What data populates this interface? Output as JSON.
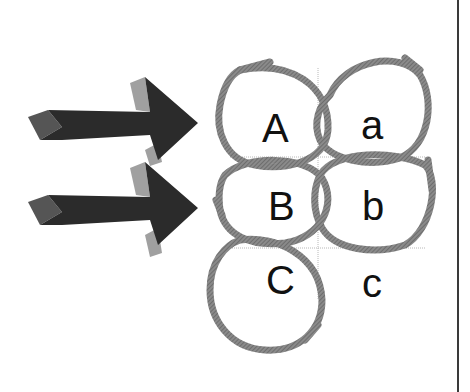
{
  "diagram": {
    "arrows": [
      {
        "name": "top-arrow",
        "direction": "right"
      },
      {
        "name": "bottom-arrow",
        "direction": "right"
      }
    ],
    "cells": [
      {
        "label": "A",
        "row": 0,
        "col": 0,
        "circled": true
      },
      {
        "label": "a",
        "row": 0,
        "col": 1,
        "circled": true
      },
      {
        "label": "B",
        "row": 1,
        "col": 0,
        "circled": true
      },
      {
        "label": "b",
        "row": 1,
        "col": 1,
        "circled": true
      },
      {
        "label": "C",
        "row": 2,
        "col": 0,
        "circled": true
      },
      {
        "label": "c",
        "row": 2,
        "col": 1,
        "circled": false
      }
    ],
    "colors": {
      "arrow_body": "#2a2a2a",
      "arrow_side": "#9a9a9a",
      "circle_stroke": "#7a7a7a",
      "guide_line": "#b0b0b0",
      "border": "#3a3a3a"
    }
  }
}
